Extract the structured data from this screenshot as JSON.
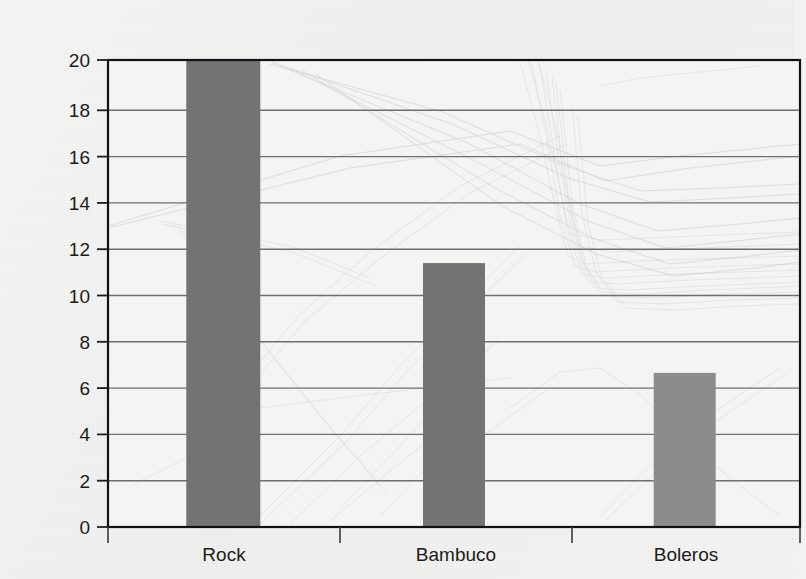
{
  "chart_data": {
    "type": "bar",
    "title": "",
    "subtitle": "",
    "xlabel": "",
    "ylabel": "",
    "categories": [
      "Rock",
      "Bambuco",
      "Boleros"
    ],
    "values": [
      20,
      11.3,
      6.6
    ],
    "series": [
      {
        "name": "",
        "values": [
          20,
          11.3,
          6.6
        ]
      }
    ],
    "ylim": [
      0,
      20
    ],
    "ytick_labels": [
      "0",
      "2",
      "4",
      "6",
      "8",
      "10",
      "12",
      "14",
      "16",
      "18",
      "20"
    ],
    "ytick_values": [
      0,
      2,
      4,
      6,
      8,
      10,
      12,
      14,
      16,
      18,
      20
    ],
    "grid": true,
    "grid_axis": "y",
    "legend": false,
    "legend_position": "none",
    "bar_colors": [
      "#737373",
      "#737373",
      "#8c8c8c"
    ]
  },
  "colors": {
    "page_background": "#f2f2f0",
    "plot_background": "#f4f4f2",
    "frame": "#111111",
    "gridline": "#6f6f6f",
    "tick_text": "#1c1c1c",
    "bar_dark": "#737373",
    "bar_light": "#8c8c8c",
    "ghost_line": "#9aa0a8"
  },
  "artifact": {
    "kind": "scanned-page-bleedthrough",
    "description": "faint line-chart lines showing through from reverse side of page"
  }
}
